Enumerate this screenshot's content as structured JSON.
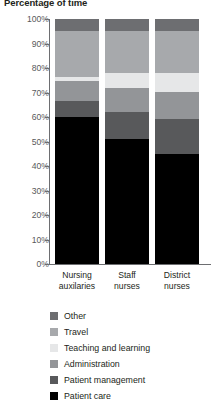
{
  "chart_data": {
    "type": "bar",
    "stacked": true,
    "normalized": true,
    "title": "Percentage of time",
    "xlabel": "",
    "ylabel": "",
    "ylim": [
      0,
      100
    ],
    "grid": false,
    "legend_position": "bottom",
    "categories": [
      "Nursing auxilaries",
      "Staff nurses",
      "District nurses"
    ],
    "category_lines": [
      [
        "Nursing",
        "auxilaries"
      ],
      [
        "Staff",
        "nurses"
      ],
      [
        "District",
        "nurses"
      ]
    ],
    "ytick_labels": [
      "100%",
      "90%",
      "80%",
      "70%",
      "60%",
      "50%",
      "40%",
      "30%",
      "20%",
      "10%",
      "0%"
    ],
    "ytick_values": [
      100,
      90,
      80,
      70,
      60,
      50,
      40,
      30,
      20,
      10,
      0
    ],
    "series": [
      {
        "name": "Other",
        "color": "#6d6e71",
        "values": [
          5,
          5,
          5
        ]
      },
      {
        "name": "Travel",
        "color": "#a7a9ac",
        "values": [
          19,
          17,
          17
        ]
      },
      {
        "name": "Teaching and learning",
        "color": "#e6e7e8",
        "values": [
          2,
          6,
          8
        ]
      },
      {
        "name": "Administration",
        "color": "#939598",
        "values": [
          8,
          10,
          11
        ]
      },
      {
        "name": "Patient management",
        "color": "#58595b",
        "values": [
          7,
          11,
          14
        ]
      },
      {
        "name": "Patient care",
        "color": "#000000",
        "values": [
          61,
          51,
          45
        ]
      }
    ],
    "legend": [
      {
        "label": "Other",
        "color": "#6d6e71"
      },
      {
        "label": "Travel",
        "color": "#a7a9ac"
      },
      {
        "label": "Teaching and learning",
        "color": "#e6e7e8"
      },
      {
        "label": "Administration",
        "color": "#939598"
      },
      {
        "label": "Patient management",
        "color": "#58595b"
      },
      {
        "label": "Patient care",
        "color": "#000000"
      }
    ]
  }
}
